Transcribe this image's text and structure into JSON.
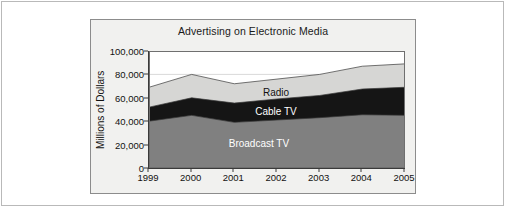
{
  "chart_data": {
    "type": "area",
    "stacked": true,
    "title": "Advertising on Electronic Media",
    "xlabel": "",
    "ylabel": "Millions of Dollars",
    "categories": [
      "1999",
      "2000",
      "2001",
      "2002",
      "2003",
      "2004",
      "2005"
    ],
    "x": [
      1999,
      2000,
      2001,
      2002,
      2003,
      2004,
      2005
    ],
    "ylim": [
      0,
      100000
    ],
    "yticks": [
      0,
      20000,
      40000,
      60000,
      80000,
      100000
    ],
    "ytick_labels": [
      "0",
      "20,000",
      "40,000",
      "60,000",
      "80,000",
      "100,000"
    ],
    "grid": true,
    "legend": "inline-labels",
    "series": [
      {
        "name": "Broadcast TV",
        "color": "#808080",
        "values": [
          40000,
          45000,
          39000,
          41000,
          43000,
          45500,
          45000
        ]
      },
      {
        "name": "Cable TV",
        "color": "#151515",
        "values": [
          12000,
          15000,
          16500,
          18000,
          19000,
          22000,
          24000
        ]
      },
      {
        "name": "Radio",
        "color": "#d6d6d4",
        "values": [
          17000,
          20000,
          16500,
          17000,
          18000,
          19500,
          20000
        ]
      }
    ],
    "cumulative_tops": {
      "Broadcast TV": [
        40000,
        45000,
        39000,
        41000,
        43000,
        45500,
        45000
      ],
      "Cable TV": [
        52000,
        60000,
        55500,
        59000,
        62000,
        67500,
        69000
      ],
      "Radio": [
        69000,
        80000,
        72000,
        76000,
        80000,
        87000,
        89000
      ]
    },
    "annotations": [
      {
        "text": "Radio",
        "x_value": 2002.0,
        "y_value": 65000
      },
      {
        "text": "Cable TV",
        "x_value": 2002.0,
        "y_value": 49000
      },
      {
        "text": "Broadcast TV",
        "x_value": 2001.6,
        "y_value": 21000
      }
    ]
  }
}
